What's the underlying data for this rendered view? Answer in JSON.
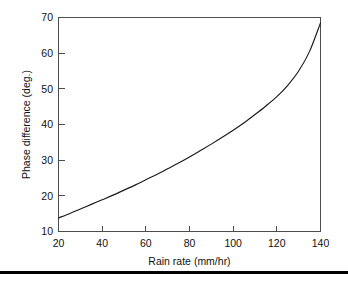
{
  "chart_data": {
    "type": "line",
    "title": "",
    "xlabel": "Rain rate (mm/hr)",
    "ylabel": "Phase difference (deg.)",
    "xlim": [
      20,
      140
    ],
    "ylim": [
      10,
      70
    ],
    "xticks": [
      20,
      40,
      60,
      80,
      100,
      120,
      140
    ],
    "yticks": [
      10,
      20,
      30,
      40,
      50,
      60,
      70
    ],
    "xtick_labels": [
      "20",
      "40",
      "60",
      "80",
      "100",
      "120",
      "140"
    ],
    "ytick_labels": [
      "10",
      "20",
      "30",
      "40",
      "50",
      "60",
      "70"
    ],
    "grid": false,
    "legend": null,
    "series": [
      {
        "name": "Phase difference vs rain rate",
        "color": "#1a1a1a",
        "x": [
          20,
          25,
          30,
          35,
          40,
          45,
          50,
          55,
          60,
          65,
          70,
          75,
          80,
          85,
          90,
          95,
          100,
          105,
          110,
          115,
          120,
          125,
          130,
          135,
          140
        ],
        "y": [
          13.8,
          15.0,
          16.3,
          17.6,
          18.9,
          20.2,
          21.6,
          23.0,
          24.5,
          26.0,
          27.6,
          29.2,
          30.9,
          32.7,
          34.5,
          36.4,
          38.4,
          40.5,
          42.8,
          45.2,
          47.8,
          51.0,
          55.0,
          60.5,
          68.5
        ]
      }
    ]
  },
  "axes": {
    "x_axis_title": "Rain rate (mm/hr)",
    "y_axis_title": "Phase difference (deg.)"
  },
  "colors": {
    "curve": "#1a1a1a",
    "frame": "#4d4d4d",
    "rule": "#000000",
    "background": "#ffffff"
  }
}
